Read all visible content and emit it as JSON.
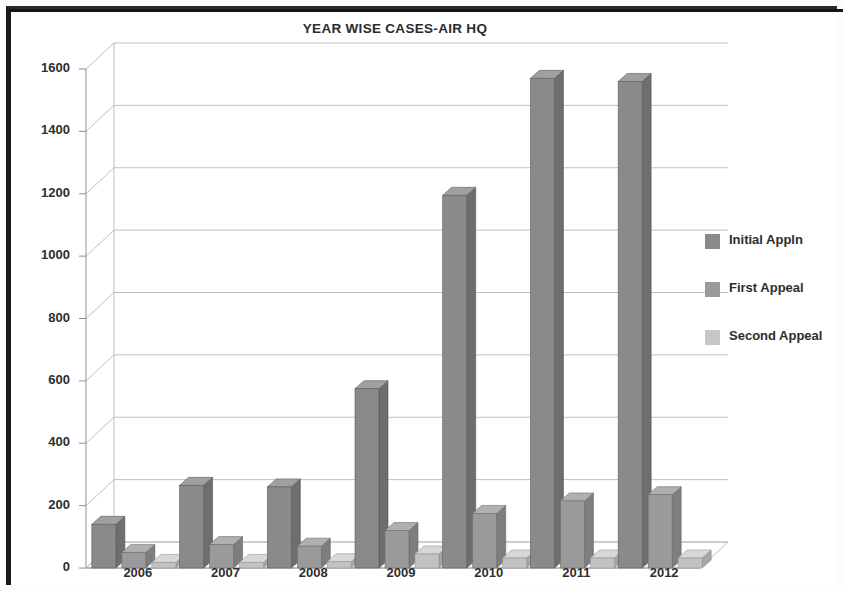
{
  "chart_data": {
    "type": "bar",
    "title": "YEAR WISE CASES-AIR HQ",
    "xlabel": "",
    "ylabel": "",
    "categories": [
      "2006",
      "2007",
      "2008",
      "2009",
      "2010",
      "2011",
      "2012"
    ],
    "series": [
      {
        "name": "Initial Appln",
        "values": [
          140,
          265,
          260,
          575,
          1195,
          1570,
          1560
        ],
        "color": "#8a8a8a"
      },
      {
        "name": "First Appeal",
        "values": [
          50,
          75,
          70,
          120,
          175,
          215,
          235
        ],
        "color": "#9a9a9a"
      },
      {
        "name": "Second Appeal",
        "values": [
          18,
          18,
          20,
          45,
          32,
          32,
          32
        ],
        "color": "#c2c2c2"
      }
    ],
    "ylim": [
      0,
      1600
    ],
    "yticks": [
      0,
      200,
      400,
      600,
      800,
      1000,
      1200,
      1400,
      1600
    ],
    "ytick_labels": [
      "0",
      "200",
      "400",
      "600",
      "800",
      "1000",
      "1200",
      "1400",
      "1600"
    ],
    "grid": true,
    "legend_position": "right",
    "style": "3d-column"
  },
  "legend": {
    "entries": [
      {
        "label": "Initial Appln",
        "swatch": "#8a8a8a"
      },
      {
        "label": "First Appeal",
        "swatch": "#9a9a9a"
      },
      {
        "label": "Second Appeal",
        "swatch": "#c6c6c6"
      }
    ]
  }
}
